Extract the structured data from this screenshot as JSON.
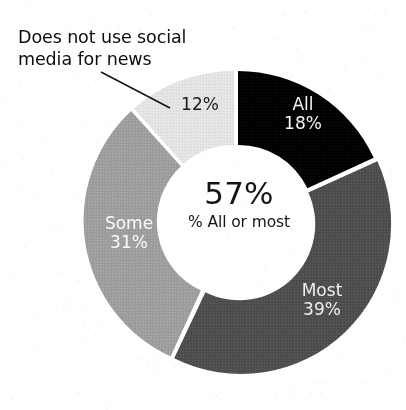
{
  "figure": {
    "annotation": {
      "text": "Does not use social\nmedia for news",
      "leader_line": "leader-line"
    },
    "center": {
      "value": "57%",
      "caption": "% All or most"
    }
  },
  "labels": {
    "all": "All\n18%",
    "most": "Most\n39%",
    "some": "Some\n31%",
    "none": "12%"
  },
  "colors": {
    "background": "#ffffff",
    "all": "#000000",
    "most": "#4e4e4e",
    "some": "#9e9e9e",
    "none": "#e2e2e2",
    "gap": "#ffffff",
    "text_dark": "#111111",
    "text_light": "#ffffff"
  },
  "chart_data": {
    "type": "pie",
    "title": "",
    "subtitle": "",
    "xlabel": "",
    "ylabel": "",
    "donut": true,
    "inner_radius_ratio": 0.51,
    "start_angle_deg": 0,
    "direction": "clockwise",
    "legend_position": "on-slices",
    "grid": false,
    "center_annotation": {
      "value": 57,
      "value_text": "57%",
      "caption": "% All or most"
    },
    "categories": [
      "All",
      "Most",
      "Some",
      "Does not use social media for news"
    ],
    "values": [
      18,
      39,
      31,
      12
    ],
    "value_labels": [
      "18%",
      "39%",
      "31%",
      "12%"
    ],
    "slice_colors": [
      "#000000",
      "#4e4e4e",
      "#9e9e9e",
      "#e2e2e2"
    ],
    "slice_label_colors": [
      "#ffffff",
      "#ffffff",
      "#ffffff",
      "#1a1a1a"
    ],
    "annotations": [
      {
        "text": "Does not use social media for news",
        "target_category": "Does not use social media for news",
        "style": "leader-line"
      }
    ]
  }
}
